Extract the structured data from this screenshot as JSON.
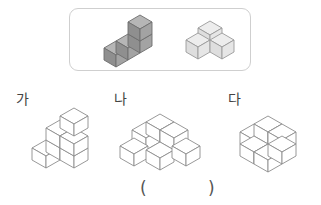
{
  "page": {
    "kind": "math-worksheet-problem",
    "language": "Korean",
    "background_color": "#ffffff"
  },
  "prompt_box": {
    "name": "given-shapes-box",
    "border_color": "#cfcfcf",
    "corner_radius_px": 9,
    "figures": [
      {
        "name": "dark-L-shape",
        "cube_count": 4,
        "fill_top": "#b6b6b6",
        "fill_left": "#8f8f8f",
        "fill_right": "#a3a3a3",
        "stroke": "#6e6e6e",
        "description": "row of three cubes with one cube stacked on the far right"
      },
      {
        "name": "light-tripod-shape",
        "cube_count": 3,
        "fill_top": "#ededed",
        "fill_left": "#dedede",
        "fill_right": "#e6e6e6",
        "stroke": "#9a9a9a",
        "description": "one cube on top with one cube to the lower-left and one to the lower-right"
      }
    ]
  },
  "options": [
    {
      "label": "가",
      "name": "option-ga",
      "cube_count": 6,
      "description": "three-step staircase rising to the back"
    },
    {
      "label": "나",
      "name": "option-na",
      "cube_count": 6,
      "description": "L-shaped back row with two cubes stepping forward"
    },
    {
      "label": "다",
      "name": "option-da",
      "cube_count": 6,
      "description": "two-by-two block of cubes with a side cube"
    }
  ],
  "answer": {
    "name": "answer-blank",
    "open_paren": "(",
    "close_paren": ")",
    "value": ""
  },
  "colors": {
    "outline_light": "#9a9a9a",
    "outline_dark": "#6e6e6e",
    "box_border": "#cfcfcf",
    "text": "#444444"
  }
}
